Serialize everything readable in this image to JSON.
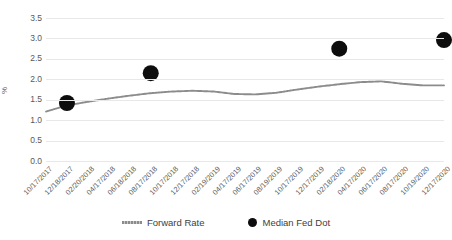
{
  "chart_data": {
    "type": "line",
    "title": "",
    "xlabel": "",
    "ylabel": "%",
    "ylim": [
      0.0,
      3.5
    ],
    "yticks": [
      "0.0",
      "0.5",
      "1.0",
      "1.5",
      "2.0",
      "2.5",
      "3.0",
      "3.5"
    ],
    "ytick_values": [
      0.0,
      0.5,
      1.0,
      1.5,
      2.0,
      2.5,
      3.0,
      3.5
    ],
    "grid": true,
    "legend_position": "bottom",
    "categories": [
      "10/17/2017",
      "12/18/2017",
      "02/20/2018",
      "04/17/2018",
      "06/18/2018",
      "08/17/2018",
      "10/17/2018",
      "12/17/2018",
      "02/19/2019",
      "04/17/2019",
      "06/17/2019",
      "08/19/2019",
      "10/17/2019",
      "12/17/2019",
      "02/18/2020",
      "04/17/2020",
      "06/17/2020",
      "08/17/2020",
      "10/19/2020",
      "12/17/2020"
    ],
    "series": [
      {
        "name": "Forward Rate",
        "type": "line",
        "color": "#8c8c8c",
        "values": [
          1.21,
          1.36,
          1.45,
          1.53,
          1.6,
          1.66,
          1.7,
          1.72,
          1.7,
          1.64,
          1.63,
          1.67,
          1.75,
          1.82,
          1.88,
          1.93,
          1.95,
          1.89,
          1.85,
          1.85
        ]
      },
      {
        "name": "Median Fed Dot",
        "type": "scatter",
        "color": "#0d0d0d",
        "points": [
          {
            "x": "12/18/2017",
            "y": 1.42
          },
          {
            "x": "08/17/2018",
            "y": 2.15
          },
          {
            "x": "02/18/2020",
            "y": 2.75
          },
          {
            "x": "12/17/2020",
            "y": 2.96
          }
        ]
      }
    ]
  },
  "legend": {
    "items": [
      {
        "label": "Forward Rate",
        "marker": "line-marker"
      },
      {
        "label": "Median Fed Dot",
        "marker": "circle-marker"
      }
    ]
  }
}
